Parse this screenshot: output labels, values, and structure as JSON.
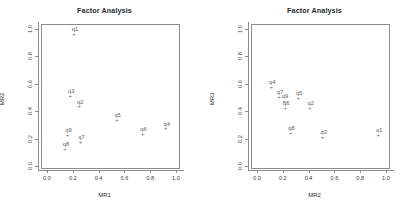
{
  "chart_data": [
    {
      "type": "scatter",
      "title": "Factor Analysis",
      "xlabel": "MR1",
      "ylabel": "MR2",
      "xlim": [
        0,
        1
      ],
      "ylim": [
        0,
        1
      ],
      "grid": false,
      "legend": null,
      "xticks": [
        "0.0",
        "0.2",
        "0.4",
        "0.6",
        "0.8",
        "1.0"
      ],
      "xtickvals": [
        0.0,
        0.2,
        0.4,
        0.6,
        0.8,
        1.0
      ],
      "yticks": [
        "0.0",
        "0.2",
        "0.4",
        "0.6",
        "0.8",
        "1.0"
      ],
      "ytickvals": [
        0.0,
        0.2,
        0.4,
        0.6,
        0.8,
        1.0
      ],
      "marker": "+",
      "points": [
        {
          "label": "q1",
          "x": 0.21,
          "y": 0.96
        },
        {
          "label": "q3",
          "x": 0.18,
          "y": 0.51
        },
        {
          "label": "q2",
          "x": 0.25,
          "y": 0.43
        },
        {
          "label": "q5",
          "x": 0.54,
          "y": 0.33
        },
        {
          "label": "q9",
          "x": 0.16,
          "y": 0.22
        },
        {
          "label": "q7",
          "x": 0.26,
          "y": 0.17
        },
        {
          "label": "q8",
          "x": 0.14,
          "y": 0.12
        },
        {
          "label": "q6",
          "x": 0.74,
          "y": 0.23
        },
        {
          "label": "q4",
          "x": 0.92,
          "y": 0.27
        }
      ]
    },
    {
      "type": "scatter",
      "title": "Factor Analysis",
      "xlabel": "MR2",
      "ylabel": "MR3",
      "xlim": [
        0,
        1
      ],
      "ylim": [
        0,
        1
      ],
      "grid": false,
      "legend": null,
      "xticks": [
        "0.0",
        "0.2",
        "0.4",
        "0.6",
        "0.8",
        "1.0"
      ],
      "xtickvals": [
        0.0,
        0.2,
        0.4,
        0.6,
        0.8,
        1.0
      ],
      "yticks": [
        "0.0",
        "0.2",
        "0.4",
        "0.6",
        "0.8",
        "1.0"
      ],
      "ytickvals": [
        0.0,
        0.2,
        0.4,
        0.6,
        0.8,
        1.0
      ],
      "marker": "+",
      "points": [
        {
          "label": "q4",
          "x": 0.11,
          "y": 0.57
        },
        {
          "label": "q7",
          "x": 0.17,
          "y": 0.5
        },
        {
          "label": "q9",
          "x": 0.21,
          "y": 0.47
        },
        {
          "label": "q6",
          "x": 0.22,
          "y": 0.42
        },
        {
          "label": "q5",
          "x": 0.32,
          "y": 0.49
        },
        {
          "label": "q2",
          "x": 0.41,
          "y": 0.42
        },
        {
          "label": "q8",
          "x": 0.26,
          "y": 0.24
        },
        {
          "label": "q3",
          "x": 0.51,
          "y": 0.21
        },
        {
          "label": "q1",
          "x": 0.94,
          "y": 0.22
        }
      ]
    }
  ],
  "colors": {
    "background": "#ffffff",
    "axis": "#8c8c8c",
    "text": "#2b2b2b",
    "point": "#6e6e6e",
    "label": "#5d5d5d"
  }
}
